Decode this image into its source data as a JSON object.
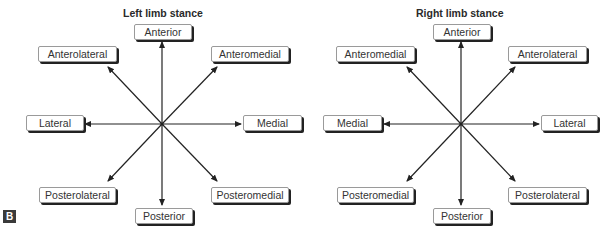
{
  "figure_label": "B",
  "panels": {
    "left": {
      "title": "Left limb stance",
      "labels": {
        "top": "Anterior",
        "top_left": "Anterolateral",
        "top_right": "Anteromedial",
        "left": "Lateral",
        "right": "Medial",
        "bottom_left": "Posterolateral",
        "bottom_right": "Posteromedial",
        "bottom": "Posterior"
      }
    },
    "right": {
      "title": "Right limb stance",
      "labels": {
        "top": "Anterior",
        "top_left": "Anteromedial",
        "top_right": "Anterolateral",
        "left": "Medial",
        "right": "Lateral",
        "bottom_left": "Posteromedial",
        "bottom_right": "Posterolateral",
        "bottom": "Posterior"
      }
    }
  },
  "colors": {
    "arrow": "#222222",
    "box_border": "#9a9a9a",
    "box_shadow": "#222222",
    "badge_bg": "#3a3a3a"
  }
}
